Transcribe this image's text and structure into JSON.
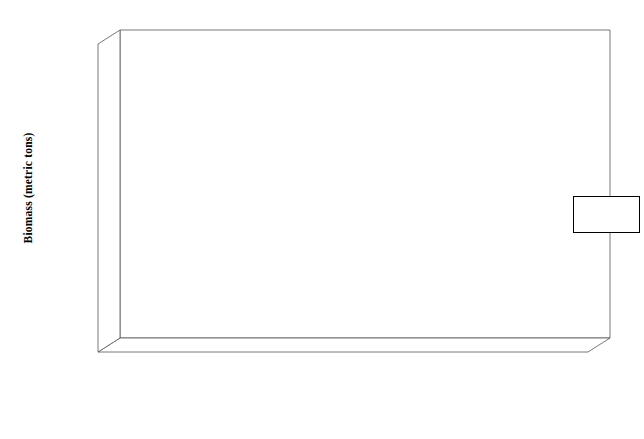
{
  "chart_data": {
    "type": "bar",
    "title": "",
    "xlabel": "",
    "ylabel": "Biomass (metric tons)",
    "ylim": [
      0,
      6000000
    ],
    "ytick_values": [
      0,
      1000000,
      2000000,
      3000000,
      4000000,
      5000000,
      6000000
    ],
    "ytick_labels": [
      "0",
      "1,000,000",
      "2,000,000",
      "3,000,000",
      "4,000,000",
      "5,000,000",
      "6,000,000"
    ],
    "grid": true,
    "legend_position": "right-upper-inside",
    "categories": [
      "Pre-commercial whaling large whales with sperm whales",
      "Current large whales with sperm whales",
      "Pre-commercial whaling large whales without sperm whales",
      "Current large whales without sperm whales",
      "Pre-commercial harvest small cetaceans",
      "Current small cetaceans",
      "Pre-commercial harvest pinnipeds",
      "Current pinnipeds"
    ],
    "category_lines": [
      [
        "Pre-",
        "commercial",
        "whaling large",
        "whales with",
        "sperm whales"
      ],
      [
        "Current large",
        "whales with",
        "sperm whales"
      ],
      [
        "Pre-",
        "commercial",
        "whaling large",
        "whales without",
        "sperm whales"
      ],
      [
        "Current large",
        "whales without",
        "sperm whales"
      ],
      [
        "Pre-",
        "commercial",
        "harvest small",
        "cetaceans"
      ],
      [
        "Current small",
        "cetaceans"
      ],
      [
        "Pre-",
        "commercial",
        "harvest",
        "pinnipeds"
      ],
      [
        "Current",
        "pinnipeds"
      ]
    ],
    "series": [
      {
        "name": "Summer",
        "color": "#000000",
        "values": [
          5691915,
          874512,
          1330168,
          538993,
          13323,
          13323,
          123766,
          62800
        ],
        "labels": [
          "5,691,915",
          "874,512",
          "1,330,168",
          "538,993",
          "13,323",
          "13,323",
          "123,766",
          "62,800"
        ]
      },
      {
        "name": "Winter",
        "color": "#ffffff",
        "values": [
          1376556,
          378694,
          507136,
          311816,
          26449,
          26449,
          238632,
          195583
        ],
        "labels": [
          "1,376,556",
          "378,694",
          "507,136",
          "311,816",
          "26,449",
          "26,449",
          "238,632",
          "195,583"
        ]
      }
    ]
  },
  "legend": {
    "items": [
      {
        "label": "Summer",
        "color": "#000000"
      },
      {
        "label": "Winter",
        "color": "#ffffff"
      }
    ]
  }
}
